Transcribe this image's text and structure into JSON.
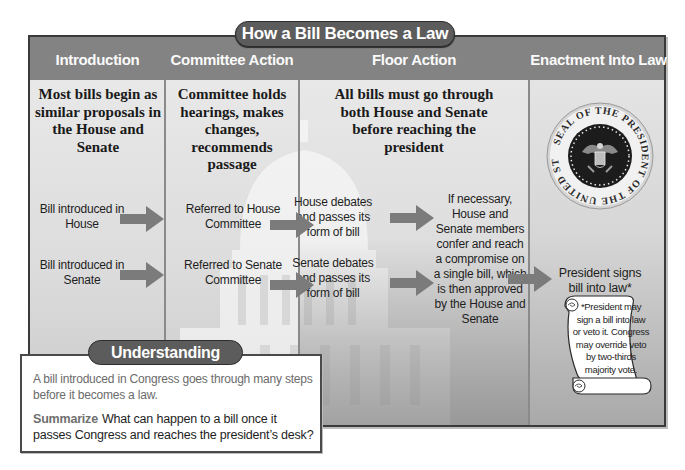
{
  "title": "How a Bill Becomes a Law",
  "colors": {
    "header_bg": "#838383",
    "pill_bg": "#5c5c5c",
    "panel_body": "#e0e0e0",
    "arrow": "#777777",
    "intro_text": "#6b6b6b"
  },
  "columns": [
    {
      "heading": "Introduction",
      "lead": "Most bills begin as similar proposals in the House and Senate",
      "steps": [
        "Bill introduced in House",
        "Bill introduced in Senate"
      ]
    },
    {
      "heading": "Committee Action",
      "lead": "Committee holds hearings, makes changes, recommends passage",
      "steps": [
        "Referred to House Committee",
        "Referred to Senate Committee"
      ]
    },
    {
      "heading": "Floor Action",
      "lead": "All bills must go through both House and Senate before reaching the president",
      "steps": [
        "House debates and passes its form of bill",
        "Senate debates and passes its form of bill",
        "If necessary, House and Senate members confer and reach a compromise on a single bill, which is then approved by the House and Senate"
      ]
    },
    {
      "heading": "Enactment Into Law",
      "seal_text": "SEAL OF THE PRESIDENT OF THE UNITED STATES",
      "steps": [
        "President signs bill into law*"
      ],
      "footnote": "*President may sign a bill into law or veto it. Congress may override veto by two-thirds majority vote."
    }
  ],
  "understanding": {
    "title": "Understanding Charts",
    "intro": "A bill introduced in Congress goes through many steps before it becomes a law.",
    "keyword": "Summarize",
    "question": "What can happen to a bill once it passes Congress and reaches the president’s desk?"
  }
}
